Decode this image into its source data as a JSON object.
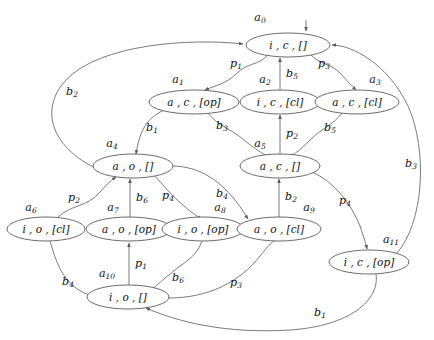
{
  "diagram": {
    "type": "automaton-graph",
    "node_shape": "ellipse",
    "colors": {
      "stroke": "#6b6b6b",
      "node_fill": "#ffffff",
      "text": "#111111",
      "background": "#ffffff"
    },
    "nodes": [
      {
        "id": "a0",
        "name": "a",
        "index": "0",
        "label": "i , c , []",
        "cx": 288,
        "cy": 45,
        "rx": 42,
        "ry": 12,
        "name_x": 260,
        "name_y": 18
      },
      {
        "id": "a1",
        "name": "a",
        "index": "1",
        "label": "a , c , [op]",
        "cx": 194,
        "cy": 102,
        "rx": 45,
        "ry": 12,
        "name_x": 178,
        "name_y": 80
      },
      {
        "id": "a2",
        "name": "a",
        "index": "2",
        "label": "i , c , [cl]",
        "cx": 280,
        "cy": 102,
        "rx": 40,
        "ry": 12,
        "name_x": 265,
        "name_y": 80
      },
      {
        "id": "a3",
        "name": "a",
        "index": "3",
        "label": "a , c , [cl]",
        "cx": 357,
        "cy": 102,
        "rx": 42,
        "ry": 12,
        "name_x": 375,
        "name_y": 80
      },
      {
        "id": "a4",
        "name": "a",
        "index": "4",
        "label": "a , o , []",
        "cx": 133,
        "cy": 166,
        "rx": 40,
        "ry": 12,
        "name_x": 112,
        "name_y": 144
      },
      {
        "id": "a5",
        "name": "a",
        "index": "5",
        "label": "a , c , []",
        "cx": 280,
        "cy": 166,
        "rx": 40,
        "ry": 12,
        "name_x": 260,
        "name_y": 144
      },
      {
        "id": "a6",
        "name": "a",
        "index": "6",
        "label": "i , o , [cl]",
        "cx": 46,
        "cy": 229,
        "rx": 39,
        "ry": 12,
        "name_x": 31,
        "name_y": 208
      },
      {
        "id": "a7",
        "name": "a",
        "index": "7",
        "label": "a , o , [op]",
        "cx": 129,
        "cy": 229,
        "rx": 43,
        "ry": 12,
        "name_x": 113,
        "name_y": 208
      },
      {
        "id": "a8",
        "name": "a",
        "index": "8",
        "label": "i , o , [op]",
        "cx": 203,
        "cy": 229,
        "rx": 41,
        "ry": 12,
        "name_x": 220,
        "name_y": 208
      },
      {
        "id": "a9",
        "name": "a",
        "index": "9",
        "label": "a , o , [cl]",
        "cx": 279,
        "cy": 229,
        "rx": 42,
        "ry": 12,
        "name_x": 309,
        "name_y": 208
      },
      {
        "id": "a10",
        "name": "a",
        "index": "10",
        "label": "i , o , []",
        "cx": 128,
        "cy": 297,
        "rx": 41,
        "ry": 12,
        "name_x": 107,
        "name_y": 274
      },
      {
        "id": "a11",
        "name": "a",
        "index": "11",
        "label": "i , c , [op]",
        "cx": 369,
        "cy": 262,
        "rx": 40,
        "ry": 12,
        "name_x": 391,
        "name_y": 240
      }
    ],
    "edges": [
      {
        "from": "start",
        "to": "a0",
        "label": "",
        "sub": "",
        "path": "M 306 20 L 306 31",
        "lx": 0,
        "ly": 0
      },
      {
        "from": "a0",
        "to": "a1",
        "label": "p",
        "sub": "1",
        "path": "M 268 55 C 258 66, 248 62, 236 74 C 226 84, 214 86, 205 90",
        "lx": 236,
        "ly": 64
      },
      {
        "from": "a2",
        "to": "a0",
        "label": "b",
        "sub": "5",
        "path": "M 280 90 L 280 58",
        "lx": 292,
        "ly": 74
      },
      {
        "from": "a0",
        "to": "a3",
        "label": "p",
        "sub": "3",
        "path": "M 311 55 C 322 66, 330 62, 341 74 C 348 82, 352 86, 356 90",
        "lx": 324,
        "ly": 64
      },
      {
        "from": "a1",
        "to": "a4",
        "label": "b",
        "sub": "1",
        "path": "M 164 110 C 148 118, 140 128, 136 154",
        "lx": 152,
        "ly": 128
      },
      {
        "from": "a1",
        "to": "a5",
        "label": "b",
        "sub": "3",
        "path": "M 208 113 C 218 126, 230 128, 244 140 C 255 149, 264 155, 272 158",
        "lx": 222,
        "ly": 126
      },
      {
        "from": "a5",
        "to": "a2",
        "label": "p",
        "sub": "2",
        "path": "M 280 154 L 280 115",
        "lx": 292,
        "ly": 134
      },
      {
        "from": "a3",
        "to": "a5",
        "label": "b",
        "sub": "5",
        "path": "M 342 113 C 332 126, 322 128, 310 140 C 302 148, 296 153, 290 157",
        "lx": 330,
        "ly": 128
      },
      {
        "from": "a4",
        "to": "a0",
        "label": "b",
        "sub": "2",
        "path": "M 102 171 C 52 150, 38 110, 66 80 C 100 44, 190 38, 243 44",
        "lx": 72,
        "ly": 92
      },
      {
        "from": "a11",
        "to": "a0",
        "label": "b",
        "sub": "3",
        "path": "M 396 254 C 424 224, 428 150, 408 106 C 388 64, 352 45, 332 45",
        "lx": 411,
        "ly": 164
      },
      {
        "from": "a6",
        "to": "a4",
        "label": "p",
        "sub": "2",
        "path": "M 58 217 C 72 204, 86 208, 100 192 C 108 183, 112 180, 116 177",
        "lx": 74,
        "ly": 198
      },
      {
        "from": "a7",
        "to": "a4",
        "label": "b",
        "sub": "6",
        "path": "M 130 217 L 130 179",
        "lx": 142,
        "ly": 198
      },
      {
        "from": "a4",
        "to": "a8",
        "label": "p",
        "sub": "4",
        "path": "M 153 174 C 164 186, 172 196, 184 206 C 192 213, 198 217, 202 219",
        "lx": 168,
        "ly": 196
      },
      {
        "from": "a4",
        "to": "a8",
        "label": "b",
        "sub": "4",
        "path": "M 172 166 C 200 166, 222 182, 238 204 C 244 212, 246 216, 248 219",
        "lx": 222,
        "ly": 194
      },
      {
        "from": "a9",
        "to": "a5",
        "label": "b",
        "sub": "2",
        "path": "M 279 217 L 279 179",
        "lx": 291,
        "ly": 197
      },
      {
        "from": "a5",
        "to": "a11",
        "label": "p",
        "sub": "4",
        "path": "M 312 172 C 334 182, 350 202, 360 226 C 364 238, 366 244, 367 249",
        "lx": 345,
        "ly": 201
      },
      {
        "from": "a10",
        "to": "a7",
        "label": "p",
        "sub": "1",
        "path": "M 129 285 L 129 243",
        "lx": 141,
        "ly": 264
      },
      {
        "from": "a8",
        "to": "a10",
        "label": "b",
        "sub": "6",
        "path": "M 202 241 C 196 258, 184 262, 170 274 C 160 282, 154 288, 150 291",
        "lx": 178,
        "ly": 278
      },
      {
        "from": "a6",
        "to": "a10",
        "label": "b",
        "sub": "4",
        "path": "M 50 241 C 56 262, 62 278, 76 288 C 84 294, 92 296, 100 297",
        "lx": 68,
        "ly": 282
      },
      {
        "from": "a10",
        "to": "a9",
        "label": "p",
        "sub": "3",
        "path": "M 169 298 C 208 298, 240 282, 260 256 C 268 246, 274 240, 277 238",
        "lx": 236,
        "ly": 283
      },
      {
        "from": "a11",
        "to": "a10",
        "label": "b",
        "sub": "1",
        "path": "M 376 274 C 380 300, 350 326, 290 330 C 226 334, 178 322, 146 308",
        "lx": 320,
        "ly": 313
      }
    ]
  }
}
